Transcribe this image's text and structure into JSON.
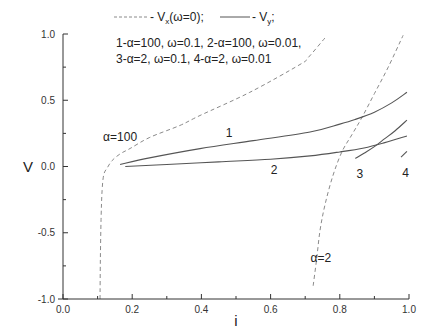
{
  "chart_data": {
    "type": "line",
    "title": "",
    "xlabel": "i",
    "ylabel": "V",
    "xlim": [
      0.0,
      1.0
    ],
    "ylim": [
      -1.0,
      1.0
    ],
    "grid": false,
    "x_ticks": [
      "0.0",
      "0.2",
      "0.4",
      "0.6",
      "0.8",
      "1.0"
    ],
    "y_ticks": [
      "-1.0",
      "-0.5",
      "0.0",
      "0.5",
      "1.0"
    ],
    "legend": {
      "position": "top-center",
      "line1": {
        "dashed_label": "- V",
        "dashed_sub": "x",
        "dashed_suffix": "(ω=0);",
        "solid_label": "- V",
        "solid_sub": "y",
        "solid_suffix": ";"
      },
      "line2": "1-α=100, ω=0.1, 2-α=100, ω=0.01,",
      "line3": "3-α=2, ω=0.1, 4-α=2, ω=0.01"
    },
    "series": [
      {
        "name": "Vx alpha=100 (omega=0)",
        "style": "dashed",
        "label": "α=100",
        "label_pos": [
          0.165,
          0.19
        ],
        "x": [
          0.107,
          0.108,
          0.11,
          0.113,
          0.118,
          0.128,
          0.142,
          0.165,
          0.194,
          0.251,
          0.338,
          0.396,
          0.54,
          0.685,
          0.708,
          0.757
        ],
        "y": [
          -1.0,
          -0.7,
          -0.4,
          -0.18,
          -0.06,
          -0.01,
          0.045,
          0.095,
          0.136,
          0.22,
          0.31,
          0.385,
          0.56,
          0.77,
          0.82,
          0.97
        ]
      },
      {
        "name": "Vx alpha=2 (omega=0)",
        "style": "dashed",
        "label": "α=2",
        "label_pos": [
          0.745,
          -0.72
        ],
        "x": [
          0.723,
          0.733,
          0.743,
          0.758,
          0.78,
          0.806,
          0.835,
          0.864,
          0.9,
          0.94,
          0.983
        ],
        "y": [
          -0.9,
          -0.7,
          -0.48,
          -0.28,
          -0.07,
          0.11,
          0.24,
          0.37,
          0.55,
          0.75,
          0.99
        ]
      },
      {
        "name": "Vy 1 (alpha=100, omega=0.1)",
        "style": "solid",
        "label": "1",
        "label_pos": [
          0.48,
          0.22
        ],
        "x": [
          0.165,
          0.25,
          0.396,
          0.55,
          0.714,
          0.8,
          0.844,
          0.9,
          0.95,
          0.994
        ],
        "y": [
          0.015,
          0.065,
          0.135,
          0.195,
          0.26,
          0.32,
          0.355,
          0.41,
          0.48,
          0.56
        ]
      },
      {
        "name": "Vy 2 (alpha=100, omega=0.01)",
        "style": "solid",
        "label": "2",
        "label_pos": [
          0.61,
          -0.06
        ],
        "x": [
          0.18,
          0.3,
          0.45,
          0.6,
          0.714,
          0.8,
          0.87,
          0.93,
          0.994
        ],
        "y": [
          0.0,
          0.015,
          0.035,
          0.055,
          0.08,
          0.11,
          0.14,
          0.18,
          0.23
        ]
      },
      {
        "name": "Vy 3 (alpha=2, omega=0.1)",
        "style": "solid",
        "label": "3",
        "label_pos": [
          0.858,
          -0.09
        ],
        "x": [
          0.845,
          0.87,
          0.9,
          0.93,
          0.96,
          0.994
        ],
        "y": [
          0.06,
          0.1,
          0.15,
          0.21,
          0.27,
          0.35
        ]
      },
      {
        "name": "Vy 4 (alpha=2, omega=0.01)",
        "style": "solid",
        "label": "4",
        "label_pos": [
          0.99,
          -0.08
        ],
        "x": [
          0.977,
          0.994
        ],
        "y": [
          0.07,
          0.115
        ]
      }
    ]
  },
  "colors": {
    "background": "#ffffff",
    "axis": "#333333",
    "dashed_line": "#8a8a8a",
    "solid_line": "#555555",
    "text": "#222222"
  }
}
